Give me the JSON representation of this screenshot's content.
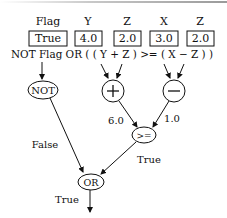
{
  "variables": [
    {
      "name": "Flag",
      "value": "True"
    },
    {
      "name": "Y",
      "value": "4.0"
    },
    {
      "name": "Z",
      "value": "2.0"
    },
    {
      "name": "X",
      "value": "3.0"
    },
    {
      "name": "Z",
      "value": "2.0"
    }
  ],
  "expression": "NOT Flag OR ( ( Y + Z ) >= ( X − Z ) )",
  "nodes": {
    "not": "NOT",
    "plus": "+",
    "minus": "−",
    "gte": ">=",
    "or": "OR"
  },
  "edge_labels": {
    "not_to_or": "False",
    "plus_to_gte": "6.0",
    "minus_to_gte": "1.0",
    "gte_to_or": "True",
    "or_output": "True"
  }
}
